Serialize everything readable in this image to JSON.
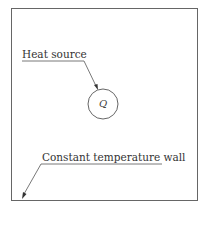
{
  "diagram": {
    "labels": {
      "heat_source": "Heat source",
      "wall": "Constant temperature wall",
      "source_symbol": "Q"
    },
    "colors": {
      "line": "#555555",
      "background": "#ffffff"
    }
  }
}
